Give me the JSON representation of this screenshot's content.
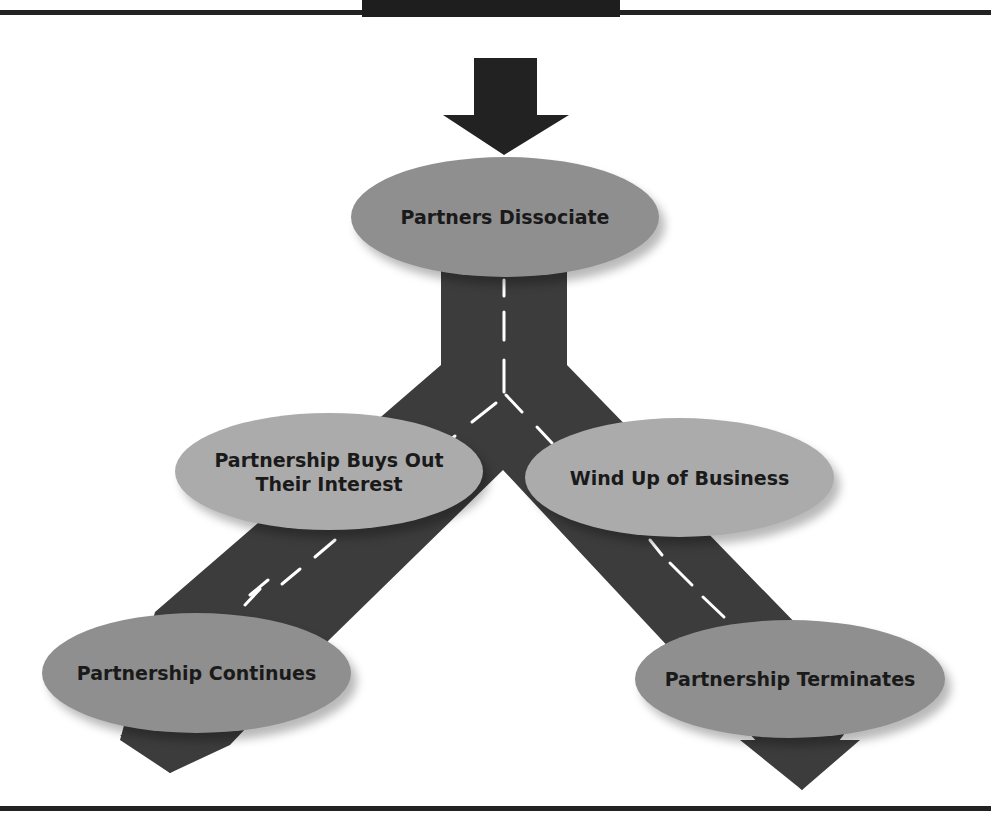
{
  "diagram": {
    "type": "flowchart-road",
    "colors": {
      "road": "#3c3c3c",
      "lane_marking": "#ffffff",
      "arrow": "#222222",
      "node_dark": "#8f8f8f",
      "node_light": "#ababab",
      "rule": "#222222"
    },
    "nodes": {
      "start": {
        "label": "Partners Dissociate"
      },
      "buyout": {
        "label_line1": "Partnership Buys Out",
        "label_line2": "Their Interest"
      },
      "windup": {
        "label": "Wind Up of Business"
      },
      "continues": {
        "label": "Partnership Continues"
      },
      "terminates": {
        "label": "Partnership Terminates"
      }
    },
    "edges": [
      {
        "from": "start",
        "to": "buyout"
      },
      {
        "from": "start",
        "to": "windup"
      },
      {
        "from": "buyout",
        "to": "continues"
      },
      {
        "from": "windup",
        "to": "terminates"
      }
    ]
  }
}
